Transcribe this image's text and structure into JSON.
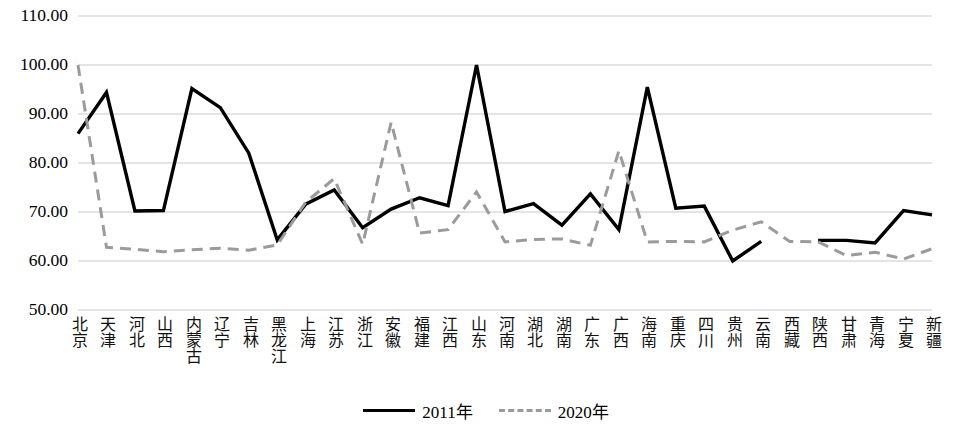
{
  "chart_data": {
    "type": "line",
    "title": "",
    "xlabel": "",
    "ylabel": "",
    "ylim": [
      50.0,
      110.0
    ],
    "y_ticks": [
      "50.00",
      "60.00",
      "70.00",
      "80.00",
      "90.00",
      "100.00",
      "110.00"
    ],
    "y_tick_values": [
      50,
      60,
      70,
      80,
      90,
      100,
      110
    ],
    "grid": true,
    "legend_position": "bottom-center",
    "categories": [
      "北京",
      "天津",
      "河北",
      "山西",
      "内蒙古",
      "辽宁",
      "吉林",
      "黑龙江",
      "上海",
      "江苏",
      "浙江",
      "安徽",
      "福建",
      "江西",
      "山东",
      "河南",
      "湖北",
      "湖南",
      "广东",
      "广西",
      "海南",
      "重庆",
      "四川",
      "贵州",
      "云南",
      "西藏",
      "陕西",
      "甘肃",
      "青海",
      "宁夏",
      "新疆"
    ],
    "series": [
      {
        "name": "2011年",
        "style": "solid",
        "color": "#000000",
        "values": [
          86.0,
          94.4,
          70.2,
          70.3,
          95.2,
          91.3,
          82.0,
          64.3,
          71.6,
          74.5,
          66.8,
          70.6,
          72.9,
          71.3,
          100.0,
          70.1,
          71.7,
          67.3,
          73.7,
          66.4,
          95.5,
          70.8,
          71.2,
          60.0,
          64.0,
          null,
          64.2,
          64.2,
          63.7,
          70.3,
          69.4
        ]
      },
      {
        "name": "2020年",
        "style": "dashed",
        "color": "#9b9b9b",
        "values": [
          100.0,
          62.8,
          62.4,
          61.9,
          62.3,
          62.6,
          62.2,
          63.3,
          72.0,
          76.8,
          63.4,
          88.3,
          65.7,
          66.4,
          74.1,
          63.9,
          64.4,
          64.5,
          63.2,
          82.5,
          63.9,
          64.0,
          63.9,
          66.3,
          68.0,
          64.0,
          63.9,
          61.1,
          61.8,
          60.4,
          62.5
        ]
      }
    ]
  },
  "legend": {
    "items": [
      {
        "label": "2011年",
        "style": "solid"
      },
      {
        "label": "2020年",
        "style": "dashed"
      }
    ]
  }
}
